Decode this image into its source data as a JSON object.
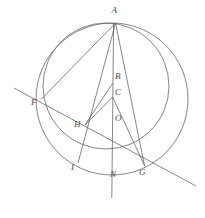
{
  "figure": {
    "kind": "euclidean-geometry-diagram",
    "width": 205,
    "height": 218,
    "background": "#ffffff",
    "stroke_color": "#595959",
    "label_color": "#4a4a4a",
    "stroke_width": 0.7
  },
  "points": [
    {
      "id": "A",
      "label": "A",
      "x": 115.5,
      "y": 23.0,
      "label_x": 111.5,
      "label_y": 9.0
    },
    {
      "id": "B",
      "label": "B",
      "x": 112.5,
      "y": 83.0,
      "label_x": 114.5,
      "label_y": 73.0
    },
    {
      "id": "C",
      "label": "C",
      "x": 112.5,
      "y": 97.0,
      "label_x": 114.5,
      "label_y": 87.0
    },
    {
      "id": "O",
      "label": "O",
      "x": 112.5,
      "y": 123.0,
      "label_x": 114.5,
      "label_y": 113.0
    },
    {
      "id": "F",
      "label": "F",
      "x": 41.0,
      "y": 99.5,
      "label_x": 33.5,
      "label_y": 101.0
    },
    {
      "id": "H",
      "label": "H",
      "x": 85.0,
      "y": 125.0,
      "label_x": 75.5,
      "label_y": 122.0
    },
    {
      "id": "I",
      "label": "I",
      "x": 78.0,
      "y": 163.0,
      "label_x": 73.0,
      "label_y": 163.0
    },
    {
      "id": "N",
      "label": "N",
      "x": 112.5,
      "y": 173.0,
      "label_x": 112.5,
      "label_y": 170.0
    },
    {
      "id": "G",
      "label": "G",
      "x": 144.5,
      "y": 165.5,
      "label_x": 140.5,
      "label_y": 168.0
    }
  ],
  "circles": [
    {
      "id": "outer-circle",
      "name": "large-circle",
      "cx": 112.0,
      "cy": 99.0,
      "r": 76.0
    },
    {
      "id": "inner-circle",
      "name": "small-circle",
      "cx": 106.0,
      "cy": 86.0,
      "r": 63.0
    }
  ],
  "segments": [
    {
      "id": "A-F",
      "name": "chord-a-f",
      "from": "A",
      "to": "F"
    },
    {
      "id": "A-I",
      "name": "chord-a-i",
      "from": "A",
      "to": "I"
    },
    {
      "id": "A-N",
      "name": "axis-a-n",
      "from": "A",
      "to": "N"
    },
    {
      "id": "A-G",
      "name": "chord-a-g",
      "from": "A",
      "to": "G"
    },
    {
      "id": "B-H",
      "name": "segment-b-h",
      "from": "B",
      "to": "H"
    },
    {
      "id": "C-H",
      "name": "segment-c-h",
      "from": "C",
      "to": "H"
    },
    {
      "id": "C-G",
      "name": "segment-c-g",
      "from": "C",
      "to": "G"
    }
  ],
  "extended_lines": [
    {
      "id": "transversal-FHG",
      "name": "transversal-line",
      "x1": 14.0,
      "y1": 88.0,
      "x2": 196.0,
      "y2": 186.0
    },
    {
      "id": "axis-vertical",
      "name": "vertical-axis-line",
      "x1": 113.5,
      "y1": 23.0,
      "x2": 111.8,
      "y2": 198.0
    }
  ],
  "labels_order": [
    "A",
    "B",
    "C",
    "O",
    "F",
    "H",
    "I",
    "N",
    "G"
  ]
}
